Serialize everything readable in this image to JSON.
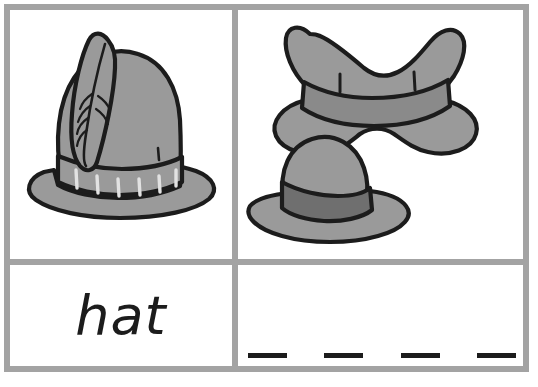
{
  "page": {
    "type": "phonics-worksheet-card",
    "background_color": "#ffffff",
    "grid_line_color": "#a3a3a3",
    "ink_color": "#1c1c1c"
  },
  "grid": {
    "rows": 2,
    "columns": 2,
    "border_width_px": 6
  },
  "cells": {
    "top_left": {
      "name": "picture-cell-single-hat",
      "content_kind": "illustration",
      "illustrations": [
        {
          "name": "alpine-hat-with-feather",
          "label": "alpine hat with feather",
          "crown_color": "#9a9a9a",
          "band_color": "#9a9a9a",
          "outline_color": "#1c1c1c",
          "highlight_color": "#d9d9d9",
          "feather_stitch_count": 6,
          "band_stitch_count": 6
        }
      ]
    },
    "top_right": {
      "name": "picture-cell-two-hats",
      "content_kind": "illustration",
      "illustrations": [
        {
          "name": "cowboy-hat",
          "label": "cowboy hat with pinched crown",
          "crown_color": "#9a9a9a",
          "band_color": "#8a8a8a",
          "outline_color": "#1c1c1c",
          "crease_marks": 2
        },
        {
          "name": "bowler-sun-hat",
          "label": "bowler sun hat with dark band",
          "crown_color": "#9a9a9a",
          "band_color": "#6f6f6f",
          "outline_color": "#1c1c1c"
        }
      ]
    },
    "bottom_left": {
      "name": "word-cell",
      "content_kind": "word",
      "word": "hat"
    },
    "bottom_right": {
      "name": "blank-writing-cell",
      "content_kind": "writing-blanks",
      "blank_count": 4,
      "blanks": [
        "",
        "",
        "",
        ""
      ],
      "dash_color": "#1c1c1c"
    }
  }
}
